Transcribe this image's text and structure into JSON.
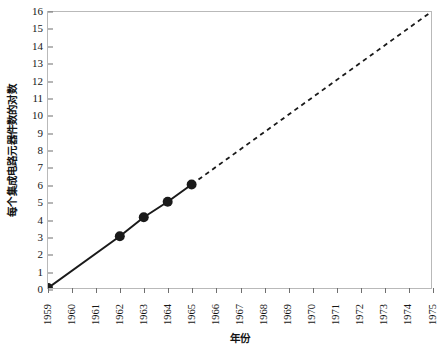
{
  "chart_data": {
    "type": "line",
    "title": "",
    "subtitle": "",
    "xlabel": "年份",
    "ylabel": "每个集成电路元器件数的对数",
    "xlim": [
      1959,
      1975
    ],
    "ylim": [
      0,
      16
    ],
    "grid": false,
    "legend": null,
    "x_tick_labels": [
      "1959",
      "1960",
      "1961",
      "1962",
      "1963",
      "1964",
      "1965",
      "1966",
      "1967",
      "1968",
      "1969",
      "1970",
      "1971",
      "1972",
      "1973",
      "1974",
      "1975"
    ],
    "y_tick_labels": [
      "0",
      "1",
      "2",
      "3",
      "4",
      "5",
      "6",
      "7",
      "8",
      "9",
      "10",
      "11",
      "12",
      "13",
      "14",
      "15",
      "16"
    ],
    "series": [
      {
        "name": "observed",
        "style": "solid",
        "marker": "filled-circle",
        "color": "#1a1a1a",
        "x": [
          1959,
          1962,
          1963,
          1964,
          1965
        ],
        "values": [
          0,
          3,
          4.1,
          5,
          6
        ]
      },
      {
        "name": "extrapolation",
        "style": "dashed",
        "marker": "none",
        "color": "#1a1a1a",
        "x": [
          1965,
          1975
        ],
        "values": [
          6,
          16
        ]
      }
    ],
    "colors": {
      "line": "#1a1a1a",
      "marker": "#1a1a1a",
      "frame": "#b9b9b9",
      "tick": "#6f6f6f",
      "background": "#ffffff"
    }
  }
}
